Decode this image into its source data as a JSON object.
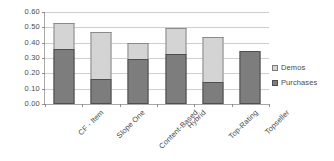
{
  "chart_data": {
    "type": "bar",
    "title": "",
    "subtitle": "",
    "xlabel": "",
    "ylabel": "",
    "stacked": true,
    "grid": true,
    "legend_position": "right",
    "ylim": [
      0.0,
      0.6
    ],
    "ytick_labels": [
      "0.60",
      "0.50",
      "0.40",
      "0.30",
      "0.20",
      "0.10",
      "0.00"
    ],
    "ytick_values": [
      0.6,
      0.5,
      0.4,
      0.3,
      0.2,
      0.1,
      0.0
    ],
    "categories": [
      "CF - Item",
      "Slope One",
      "Content-Based",
      "Hybrid",
      "Top-Rating",
      "Topseller"
    ],
    "series": [
      {
        "name": "Purchases",
        "color": "#7d7d7d",
        "values": [
          0.36,
          0.165,
          0.295,
          0.325,
          0.145,
          0.345
        ]
      },
      {
        "name": "Demos",
        "color": "#d4d4d4",
        "values": [
          0.17,
          0.305,
          0.105,
          0.17,
          0.295,
          0.0
        ]
      }
    ],
    "totals": [
      0.53,
      0.47,
      0.4,
      0.495,
      0.44,
      0.345
    ]
  },
  "legend": {
    "items": [
      {
        "label": "Demos",
        "swatch": "demos"
      },
      {
        "label": "Purchases",
        "swatch": "purchases"
      }
    ]
  }
}
